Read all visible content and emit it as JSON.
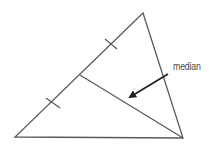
{
  "diagram": {
    "label": "median",
    "colors": {
      "triangle_stroke": "#5a5a5a",
      "median_stroke": "#5a5a5a",
      "arrow": "#1e1e1e",
      "label": "#4a4a4a"
    },
    "vertices": {
      "apex": [
        143,
        13
      ],
      "bottom_left": [
        15,
        137
      ],
      "bottom_right": [
        183,
        138
      ]
    },
    "midpoint": [
      80,
      75
    ],
    "tick_marks": [
      {
        "center": [
          111,
          44
        ]
      },
      {
        "center": [
          53,
          103
        ]
      }
    ],
    "arrow": {
      "from": [
        168,
        74
      ],
      "to": [
        128,
        98
      ]
    },
    "label_position": [
      173,
      62
    ]
  }
}
